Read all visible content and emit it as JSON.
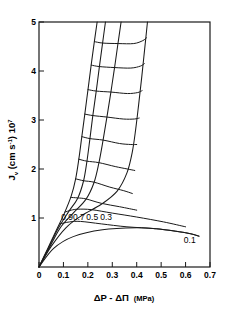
{
  "chart_data": {
    "type": "line",
    "title": "",
    "xlabel": "ΔP - ΔΠ  (MPa)",
    "xlabel_main": "ΔP - ΔΠ",
    "xlabel_units": "(MPa)",
    "ylabel": "J",
    "ylabel_sub": "v",
    "ylabel_rest": " (cm s",
    "ylabel_exp1": "-1",
    "ylabel_rest2": ") 10",
    "ylabel_exp2": "7",
    "xlim": [
      0,
      0.7
    ],
    "ylim": [
      0,
      5
    ],
    "xticks": [
      0,
      0.1,
      0.2,
      0.3,
      0.4,
      0.5,
      0.6,
      0.7
    ],
    "xtick_labels": [
      "0",
      "0.1",
      "0.2",
      "0.3",
      "0.4",
      "0.5",
      "0.6",
      "0.7"
    ],
    "yticks": [
      1,
      2,
      3,
      4,
      5
    ],
    "ytick_labels": [
      "1",
      "2",
      "3",
      "4",
      "5"
    ],
    "grid": false,
    "legend": "none",
    "line_color": "#1a1a1a",
    "background_color": "#ffffff",
    "series": [
      {
        "name": "0.9",
        "label": "0.9",
        "label_x": 0.115,
        "label_y": 0.96,
        "points": [
          [
            0.0,
            0.0
          ],
          [
            0.035,
            0.37
          ],
          [
            0.07,
            0.74
          ],
          [
            0.105,
            1.11
          ],
          [
            0.132,
            1.45
          ],
          [
            0.15,
            1.8
          ],
          [
            0.163,
            2.2
          ],
          [
            0.175,
            2.65
          ],
          [
            0.187,
            3.1
          ],
          [
            0.2,
            3.6
          ],
          [
            0.213,
            4.1
          ],
          [
            0.226,
            4.58
          ],
          [
            0.238,
            5.0
          ]
        ]
      },
      {
        "name": "0.7",
        "label": "0.7",
        "label_x": 0.163,
        "label_y": 0.95,
        "points": [
          [
            0.0,
            0.0
          ],
          [
            0.04,
            0.4
          ],
          [
            0.08,
            0.8
          ],
          [
            0.12,
            1.12
          ],
          [
            0.158,
            1.4
          ],
          [
            0.182,
            1.75
          ],
          [
            0.196,
            2.15
          ],
          [
            0.208,
            2.6
          ],
          [
            0.22,
            3.08
          ],
          [
            0.234,
            3.58
          ],
          [
            0.247,
            4.08
          ],
          [
            0.26,
            4.56
          ],
          [
            0.272,
            5.0
          ]
        ]
      },
      {
        "name": "0.5",
        "label": "0.5",
        "label_x": 0.218,
        "label_y": 0.95,
        "points": [
          [
            0.0,
            0.0
          ],
          [
            0.045,
            0.42
          ],
          [
            0.09,
            0.82
          ],
          [
            0.14,
            1.1
          ],
          [
            0.192,
            1.38
          ],
          [
            0.225,
            1.72
          ],
          [
            0.245,
            2.12
          ],
          [
            0.262,
            2.58
          ],
          [
            0.278,
            3.06
          ],
          [
            0.294,
            3.56
          ],
          [
            0.309,
            4.06
          ],
          [
            0.323,
            4.55
          ],
          [
            0.336,
            5.0
          ]
        ]
      },
      {
        "name": "0.3",
        "label": "0.3",
        "label_x": 0.275,
        "label_y": 0.95,
        "points": [
          [
            0.0,
            0.0
          ],
          [
            0.05,
            0.42
          ],
          [
            0.11,
            0.8
          ],
          [
            0.175,
            1.05
          ],
          [
            0.255,
            1.28
          ],
          [
            0.32,
            1.55
          ],
          [
            0.36,
            1.92
          ],
          [
            0.382,
            2.35
          ],
          [
            0.396,
            2.82
          ],
          [
            0.408,
            3.32
          ],
          [
            0.42,
            3.85
          ],
          [
            0.432,
            4.42
          ],
          [
            0.444,
            5.0
          ]
        ]
      },
      {
        "name": "0.1",
        "label": "0.1",
        "label_x": 0.617,
        "label_y": 0.5,
        "points": [
          [
            0.0,
            0.0
          ],
          [
            0.06,
            0.38
          ],
          [
            0.14,
            0.62
          ],
          [
            0.26,
            0.76
          ],
          [
            0.4,
            0.8
          ],
          [
            0.48,
            0.78
          ],
          [
            0.56,
            0.73
          ],
          [
            0.62,
            0.68
          ],
          [
            0.655,
            0.63
          ]
        ]
      }
    ],
    "mesh_curves": [
      {
        "name": "mesh-1",
        "points": [
          [
            0.085,
            0.88
          ],
          [
            0.125,
            0.92
          ],
          [
            0.17,
            0.93
          ],
          [
            0.255,
            0.88
          ],
          [
            0.36,
            0.82
          ],
          [
            0.48,
            0.78
          ],
          [
            0.6,
            0.7
          ],
          [
            0.655,
            0.63
          ]
        ]
      },
      {
        "name": "mesh-2",
        "points": [
          [
            0.106,
            1.12
          ],
          [
            0.132,
            1.16
          ],
          [
            0.16,
            1.18
          ],
          [
            0.215,
            1.17
          ],
          [
            0.3,
            1.1
          ],
          [
            0.4,
            1.02
          ],
          [
            0.51,
            0.92
          ],
          [
            0.6,
            0.82
          ]
        ]
      },
      {
        "name": "mesh-3",
        "points": [
          [
            0.13,
            1.42
          ],
          [
            0.158,
            1.41
          ],
          [
            0.192,
            1.39
          ],
          [
            0.255,
            1.3
          ],
          [
            0.33,
            1.23
          ],
          [
            0.4,
            1.16
          ]
        ]
      },
      {
        "name": "mesh-4",
        "points": [
          [
            0.15,
            1.8
          ],
          [
            0.183,
            1.76
          ],
          [
            0.226,
            1.73
          ],
          [
            0.29,
            1.63
          ],
          [
            0.345,
            1.56
          ],
          [
            0.382,
            1.5
          ]
        ]
      },
      {
        "name": "mesh-5",
        "points": [
          [
            0.163,
            2.2
          ],
          [
            0.196,
            2.16
          ],
          [
            0.245,
            2.13
          ],
          [
            0.312,
            2.05
          ],
          [
            0.362,
            2.0
          ],
          [
            0.392,
            1.97
          ]
        ]
      },
      {
        "name": "mesh-6",
        "points": [
          [
            0.176,
            2.66
          ],
          [
            0.209,
            2.62
          ],
          [
            0.262,
            2.59
          ],
          [
            0.33,
            2.52
          ],
          [
            0.376,
            2.5
          ],
          [
            0.4,
            2.5
          ]
        ]
      },
      {
        "name": "mesh-7",
        "points": [
          [
            0.188,
            3.12
          ],
          [
            0.221,
            3.09
          ],
          [
            0.278,
            3.06
          ],
          [
            0.345,
            3.02
          ],
          [
            0.39,
            3.02
          ],
          [
            0.41,
            3.04
          ]
        ]
      },
      {
        "name": "mesh-8",
        "points": [
          [
            0.201,
            3.62
          ],
          [
            0.235,
            3.59
          ],
          [
            0.295,
            3.57
          ],
          [
            0.362,
            3.54
          ],
          [
            0.404,
            3.56
          ],
          [
            0.422,
            3.6
          ]
        ]
      },
      {
        "name": "mesh-9",
        "points": [
          [
            0.214,
            4.12
          ],
          [
            0.248,
            4.09
          ],
          [
            0.31,
            4.07
          ],
          [
            0.376,
            4.06
          ],
          [
            0.415,
            4.1
          ],
          [
            0.431,
            4.15
          ]
        ]
      },
      {
        "name": "mesh-10",
        "points": [
          [
            0.227,
            4.6
          ],
          [
            0.261,
            4.57
          ],
          [
            0.324,
            4.56
          ],
          [
            0.388,
            4.56
          ],
          [
            0.425,
            4.62
          ],
          [
            0.44,
            4.68
          ]
        ]
      }
    ]
  }
}
